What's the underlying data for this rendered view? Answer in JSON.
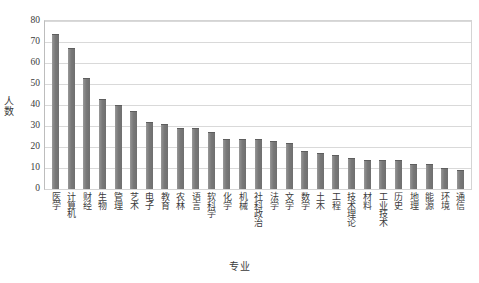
{
  "chart_data": {
    "type": "bar",
    "title": "",
    "xlabel": "专业",
    "ylabel": "人数",
    "ylim": [
      0,
      80
    ],
    "ytick_step": 10,
    "yticks": [
      80,
      70,
      60,
      50,
      40,
      30,
      20,
      10,
      0
    ],
    "grid": true,
    "legend": null,
    "bar_color": "#7b7b7b",
    "categories": [
      "医学",
      "计算机",
      "财经",
      "生物",
      "管理",
      "艺术",
      "电子",
      "教育",
      "农林",
      "语言",
      "软科学",
      "化学",
      "机械",
      "社科政治",
      "法学",
      "文学",
      "数学",
      "土木",
      "工程",
      "技术理论",
      "材料",
      "工业技术",
      "历史",
      "地理",
      "能源",
      "环境",
      "通信"
    ],
    "values": [
      74,
      67,
      53,
      43,
      40,
      37,
      32,
      31,
      29,
      29,
      27,
      24,
      24,
      24,
      23,
      22,
      18,
      17,
      16,
      15,
      14,
      14,
      14,
      12,
      12,
      10,
      9
    ]
  }
}
